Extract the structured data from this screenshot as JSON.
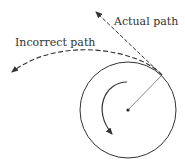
{
  "labels": {
    "actual": "Actual path",
    "incorrect": "Incorrect path"
  },
  "colors": {
    "stroke": "#333333"
  }
}
